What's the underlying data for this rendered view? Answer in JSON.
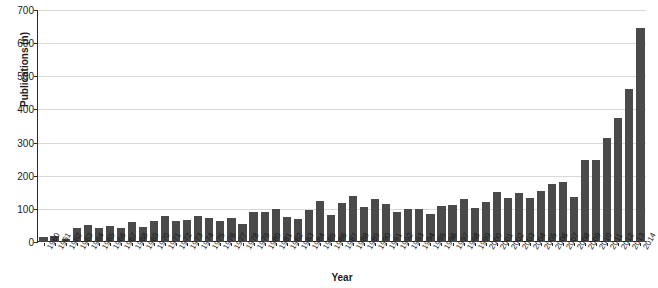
{
  "chart_data": {
    "type": "bar",
    "title": "",
    "subtitle": "",
    "xlabel": "Year",
    "ylabel": "Publications (n)",
    "ylim": [
      0,
      700
    ],
    "ytick_values": [
      0,
      100,
      200,
      300,
      400,
      500,
      600,
      700
    ],
    "ytick_labels": [
      "0",
      "100",
      "200",
      "300",
      "400",
      "500",
      "600",
      "700"
    ],
    "grid": "horizontal",
    "legend": "none",
    "bar_color": "#4a4a4a",
    "gridline_color": "#d8d8d8",
    "axis_color": "#2b2b2b",
    "categories": [
      "1960",
      "1961",
      "1962",
      "1963",
      "1964",
      "1965",
      "1966",
      "1967",
      "1968",
      "1969",
      "1970",
      "1971",
      "1972",
      "1973",
      "1974",
      "1975",
      "1976",
      "1977",
      "1978",
      "1979",
      "1980",
      "1981",
      "1982",
      "1983",
      "1984",
      "1985",
      "1986",
      "1987",
      "1988",
      "1989",
      "1990",
      "1991",
      "1992",
      "1993",
      "1994",
      "1995",
      "1996",
      "1997",
      "1998",
      "1999",
      "2000",
      "2001",
      "2002",
      "2003",
      "2004",
      "2005",
      "2006",
      "2007",
      "2008",
      "2009",
      "2010",
      "2011",
      "2012",
      "2013",
      "2014"
    ],
    "values": [
      15,
      19,
      8,
      42,
      52,
      43,
      48,
      43,
      60,
      44,
      62,
      78,
      62,
      66,
      80,
      72,
      63,
      73,
      53,
      90,
      92,
      100,
      76,
      68,
      98,
      125,
      83,
      118,
      138,
      106,
      131,
      115,
      92,
      99,
      100,
      85,
      110,
      111,
      130,
      102,
      120,
      152,
      134,
      147,
      133,
      155,
      174,
      182,
      136,
      246,
      247,
      313,
      375,
      463,
      645
    ]
  }
}
